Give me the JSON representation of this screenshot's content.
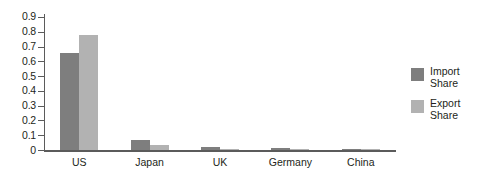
{
  "chart_data": {
    "type": "bar",
    "title": "",
    "subtitle": "",
    "xlabel": "",
    "ylabel": "",
    "ylim": [
      0,
      0.9
    ],
    "grid": false,
    "legend_position": "right",
    "categories": [
      "US",
      "Japan",
      "UK",
      "Germany",
      "China"
    ],
    "y_ticks": [
      "0",
      "0.1",
      "0.2",
      "0.3",
      "0.4",
      "0.5",
      "0.6",
      "0.7",
      "0.8",
      "0.9"
    ],
    "y_tick_values": [
      0,
      0.1,
      0.2,
      0.3,
      0.4,
      0.5,
      0.6,
      0.7,
      0.8,
      0.9
    ],
    "series": [
      {
        "name": "Import Share",
        "legend_line1": "Import",
        "legend_line2": "Share",
        "color": "#7e7e7e",
        "values": [
          0.655,
          0.068,
          0.02,
          0.013,
          0.004
        ]
      },
      {
        "name": "Export Share",
        "legend_line1": "Export",
        "legend_line2": "Share",
        "color": "#b2b2b2",
        "values": [
          0.78,
          0.037,
          0.008,
          0.004,
          0.003
        ]
      }
    ]
  },
  "colors": {
    "import": "#7e7e7e",
    "export": "#b2b2b2",
    "axis": "#5b5b5b",
    "text": "#231f20",
    "background": "#ffffff"
  }
}
